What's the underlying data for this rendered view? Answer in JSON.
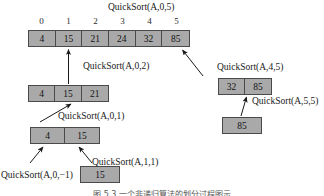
{
  "figure": {
    "caption": "图 5.3  一个非递归算法的划分过程图示"
  },
  "colors": {
    "cell_fill": "#a9a9a9",
    "cell_border": "#4a4a4a",
    "text": "#111111",
    "arrow": "#1a1a1a",
    "background": "#ffffff"
  },
  "labels": {
    "root": "QuickSort(A,0,5)",
    "left_0_2": "QuickSort(A,0,2)",
    "right_4_5": "QuickSort(A,4,5)",
    "left_0_1": "QuickSort(A,0,1)",
    "right_5_5": "QuickSort(A,5,5)",
    "left_0_m1": "QuickSort(A,0,−1)",
    "right_1_1": "QuickSort(A,1,1)"
  },
  "indices": {
    "values": [
      "0",
      "1",
      "2",
      "3",
      "4",
      "5"
    ]
  },
  "arrays": {
    "root": {
      "name": "root-array",
      "values": [
        "4",
        "15",
        "21",
        "24",
        "32",
        "85"
      ]
    },
    "left_0_2": {
      "name": "left-subarray-0-2",
      "values": [
        "4",
        "15",
        "21"
      ]
    },
    "right_4_5": {
      "name": "right-subarray-4-5",
      "values": [
        "32",
        "85"
      ]
    },
    "left_0_1": {
      "name": "left-subarray-0-1",
      "values": [
        "4",
        "15"
      ]
    },
    "right_5_5": {
      "name": "right-subarray-5-5",
      "values": [
        "85"
      ]
    },
    "right_1_1": {
      "name": "right-subarray-1-1",
      "values": [
        "15"
      ]
    }
  }
}
